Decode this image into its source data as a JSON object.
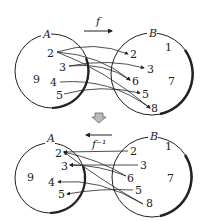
{
  "top": {
    "function_label": "f",
    "set_a": {
      "label": "A",
      "elements": [
        "2",
        "3",
        "9",
        "4",
        "5"
      ]
    },
    "set_b": {
      "label": "B",
      "elements": [
        "2",
        "1",
        "3",
        "6",
        "7",
        "5",
        "8"
      ]
    },
    "mappings": [
      [
        "2",
        "2"
      ],
      [
        "2",
        "6"
      ],
      [
        "2",
        "8"
      ],
      [
        "3",
        "3"
      ],
      [
        "3",
        "6"
      ],
      [
        "4",
        "8"
      ],
      [
        "5",
        "5"
      ]
    ]
  },
  "arrow_between": "down-arrow",
  "bottom": {
    "function_label": "f⁻¹",
    "set_a": {
      "label": "A",
      "elements": [
        "2",
        "3",
        "9",
        "4",
        "5"
      ]
    },
    "set_b": {
      "label": "B",
      "elements": [
        "2",
        "1",
        "3",
        "6",
        "7",
        "5",
        "8"
      ]
    },
    "mappings": [
      [
        "2",
        "2"
      ],
      [
        "6",
        "2"
      ],
      [
        "8",
        "2"
      ],
      [
        "3",
        "3"
      ],
      [
        "6",
        "3"
      ],
      [
        "8",
        "4"
      ],
      [
        "5",
        "5"
      ]
    ]
  }
}
